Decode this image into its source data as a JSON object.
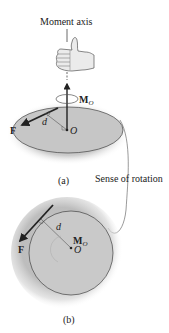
{
  "figure": {
    "top_label": "Moment axis",
    "rotation_label": "Sense of rotation",
    "panel_a": {
      "caption": "(a)",
      "force_label": "F",
      "distance_label": "d",
      "origin_label": "O",
      "moment_label": "M",
      "moment_subscript": "O"
    },
    "panel_b": {
      "caption": "(b)",
      "force_label": "F",
      "distance_label": "d",
      "origin_label": "O",
      "moment_label": "M",
      "moment_subscript": "O"
    }
  },
  "colors": {
    "line": "#333333",
    "shade": "#bdbdbd",
    "ellipse_fill": "#c8c8c8",
    "hand": "#e8e8e8"
  }
}
